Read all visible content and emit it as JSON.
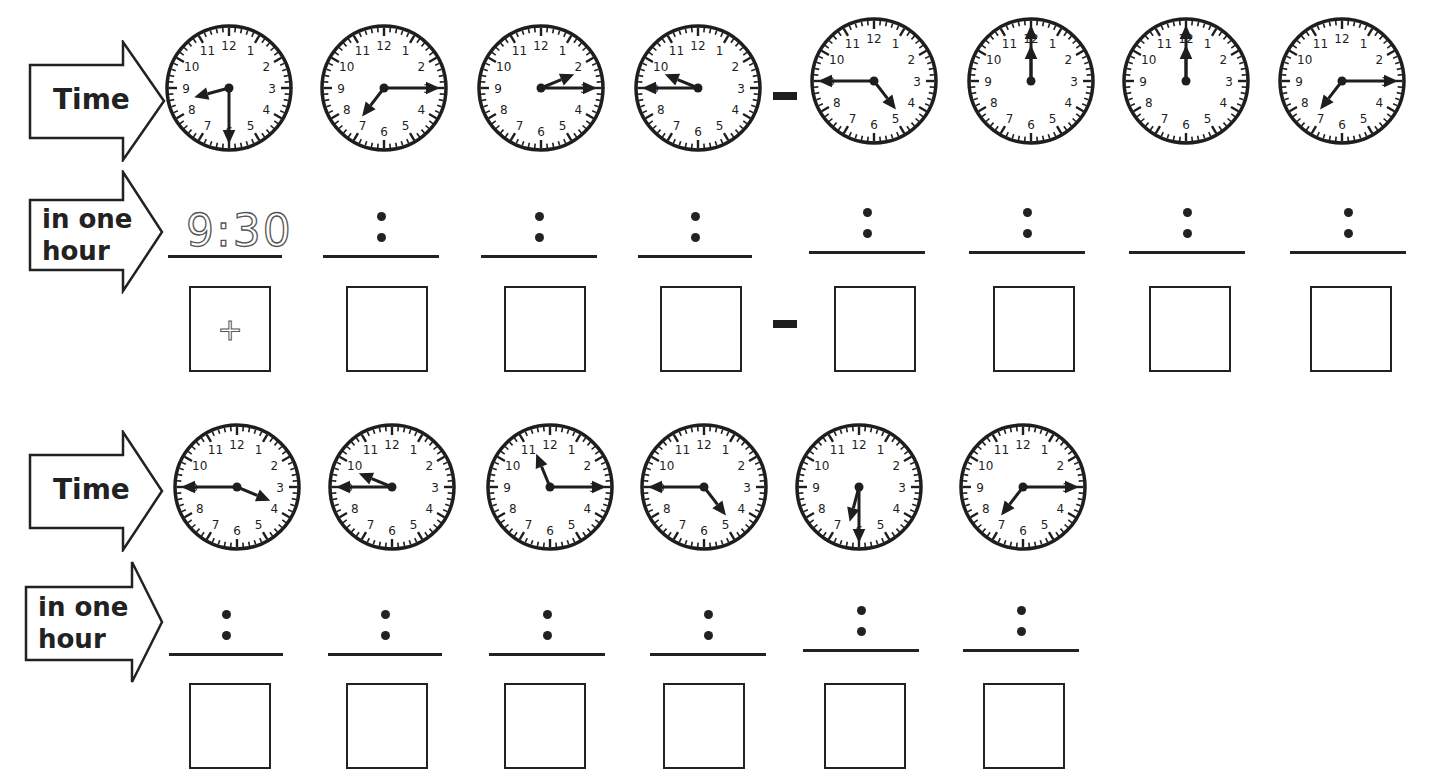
{
  "worksheet": {
    "row_labels": {
      "time": "Time",
      "in_one_hour_line1": "in one",
      "in_one_hour_line2": "hour"
    },
    "colon": ":",
    "equals_symbol": "=",
    "example": {
      "answer_text": "9:30",
      "box_symbol": "+"
    },
    "sections": [
      {
        "id": "section-1",
        "clocks": [
          {
            "time": "8:30",
            "hour": 8,
            "minute": 30
          },
          {
            "time": "7:15",
            "hour": 7,
            "minute": 15
          },
          {
            "time": "2:15",
            "hour": 2,
            "minute": 15
          },
          {
            "time": "9:45",
            "hour": 9,
            "minute": 45
          },
          {
            "time": "4:45",
            "hour": 4,
            "minute": 45
          },
          {
            "time": "12:00",
            "hour": 12,
            "minute": 0
          },
          {
            "time": "12:00",
            "hour": 12,
            "minute": 0
          },
          {
            "time": "7:15",
            "hour": 7,
            "minute": 15
          }
        ],
        "answers": [
          "9:30",
          "",
          "",
          "",
          "",
          "",
          "",
          ""
        ],
        "boxes": [
          "+",
          "",
          "",
          "",
          "",
          "",
          "",
          ""
        ]
      },
      {
        "id": "section-2",
        "clocks": [
          {
            "time": "3:45",
            "hour": 3,
            "minute": 45
          },
          {
            "time": "9:45",
            "hour": 9,
            "minute": 45
          },
          {
            "time": "11:15",
            "hour": 11,
            "minute": 15
          },
          {
            "time": "4:45",
            "hour": 4,
            "minute": 45
          },
          {
            "time": "6:30",
            "hour": 6,
            "minute": 30
          },
          {
            "time": "7:15",
            "hour": 7,
            "minute": 15
          }
        ],
        "answers": [
          "",
          "",
          "",
          "",
          "",
          ""
        ],
        "boxes": [
          "",
          "",
          "",
          "",
          "",
          ""
        ]
      }
    ],
    "clock_numerals": [
      "12",
      "1",
      "2",
      "3",
      "4",
      "5",
      "6",
      "7",
      "8",
      "9",
      "10",
      "11"
    ],
    "colors": {
      "ink": "#1e1e1e",
      "paper": "#ffffff",
      "example_dashed": "#555555"
    }
  }
}
